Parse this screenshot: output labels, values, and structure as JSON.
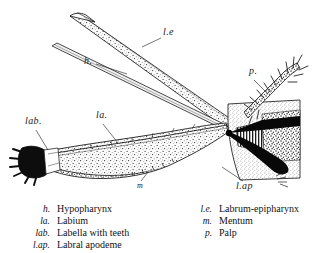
{
  "figure": {
    "labels": [
      {
        "id": "le",
        "text": "l.e",
        "x": 163,
        "y": 33,
        "size": "normal"
      },
      {
        "id": "h",
        "text": "h.",
        "x": 84,
        "y": 62,
        "size": "normal"
      },
      {
        "id": "p",
        "text": "p.",
        "x": 249,
        "y": 72,
        "size": "normal"
      },
      {
        "id": "lab",
        "text": "lab.",
        "x": 25,
        "y": 122,
        "size": "normal"
      },
      {
        "id": "la",
        "text": "la.",
        "x": 96,
        "y": 116,
        "size": "normal"
      },
      {
        "id": "m",
        "text": "m",
        "x": 137,
        "y": 183,
        "size": "small"
      },
      {
        "id": "lap",
        "text": "l.ap",
        "x": 236,
        "y": 184,
        "size": "normal"
      }
    ]
  },
  "legend": {
    "left_column": [
      {
        "abbr": "h.",
        "term": "Hypopharynx"
      },
      {
        "abbr": "la.",
        "term": "Labium"
      },
      {
        "abbr": "lab.",
        "term": "Labella with teeth"
      },
      {
        "abbr": "l.ap.",
        "term": "Labral apodeme"
      }
    ],
    "right_column": [
      {
        "abbr": "l.e.",
        "term": "Labrum-epipharynx"
      },
      {
        "abbr": "m.",
        "term": "Mentum"
      },
      {
        "abbr": "p.",
        "term": "Palp"
      }
    ]
  }
}
